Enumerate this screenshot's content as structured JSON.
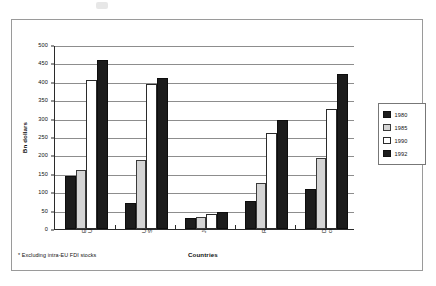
{
  "chart_data": {
    "type": "bar",
    "title": "",
    "xlabel": "Countries",
    "ylabel": "Bn dollars",
    "ylim": [
      0,
      500
    ],
    "ytick_step": 50,
    "yticks": [
      "0",
      "50",
      "100",
      "150",
      "200",
      "250",
      "300",
      "350",
      "400",
      "450",
      "500"
    ],
    "grid": true,
    "legend_position": "right",
    "categories": [
      "European\nUnion *",
      "United\nStates",
      "Japan",
      "Rest OECD",
      "Developing\ncountries"
    ],
    "series": [
      {
        "name": "1980",
        "color": "#1c1c1c",
        "style": "dark",
        "values": [
          145,
          72,
          31,
          75,
          110
        ]
      },
      {
        "name": "1985",
        "color": "#d4d4d4",
        "style": "light",
        "values": [
          160,
          188,
          33,
          125,
          192
        ]
      },
      {
        "name": "1990",
        "color": "#ffffff",
        "style": "white",
        "values": [
          405,
          395,
          42,
          260,
          327
        ]
      },
      {
        "name": "1992",
        "color": "#1c1c1c",
        "style": "dark",
        "values": [
          458,
          410,
          47,
          297,
          420
        ]
      }
    ],
    "footnote": "* Excluding intra-EU FDI stocks"
  },
  "axes": {
    "y_title": "Bn dollars",
    "x_title": "Countries"
  },
  "legend": {
    "entries": [
      {
        "label": "1980",
        "style": "dark"
      },
      {
        "label": "1985",
        "style": "light"
      },
      {
        "label": "1990",
        "style": "white"
      },
      {
        "label": "1992",
        "style": "dark"
      }
    ]
  },
  "footnote": {
    "text": "* Excluding intra-EU FDI stocks"
  }
}
